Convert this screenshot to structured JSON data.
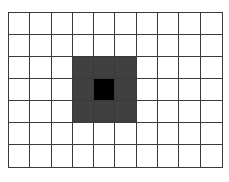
{
  "grid": {
    "columns": 10,
    "rows": 7,
    "line_color": "#3a3a3a",
    "empty_color": "#ffffff",
    "highlighted_cells": [
      {
        "row": 2,
        "col": 3,
        "color": "#404040"
      },
      {
        "row": 2,
        "col": 4,
        "color": "#404040"
      },
      {
        "row": 2,
        "col": 5,
        "color": "#404040"
      },
      {
        "row": 3,
        "col": 3,
        "color": "#404040"
      },
      {
        "row": 3,
        "col": 4,
        "color": "#000000"
      },
      {
        "row": 3,
        "col": 5,
        "color": "#404040"
      },
      {
        "row": 4,
        "col": 3,
        "color": "#404040"
      },
      {
        "row": 4,
        "col": 4,
        "color": "#404040"
      },
      {
        "row": 4,
        "col": 5,
        "color": "#404040"
      }
    ]
  }
}
